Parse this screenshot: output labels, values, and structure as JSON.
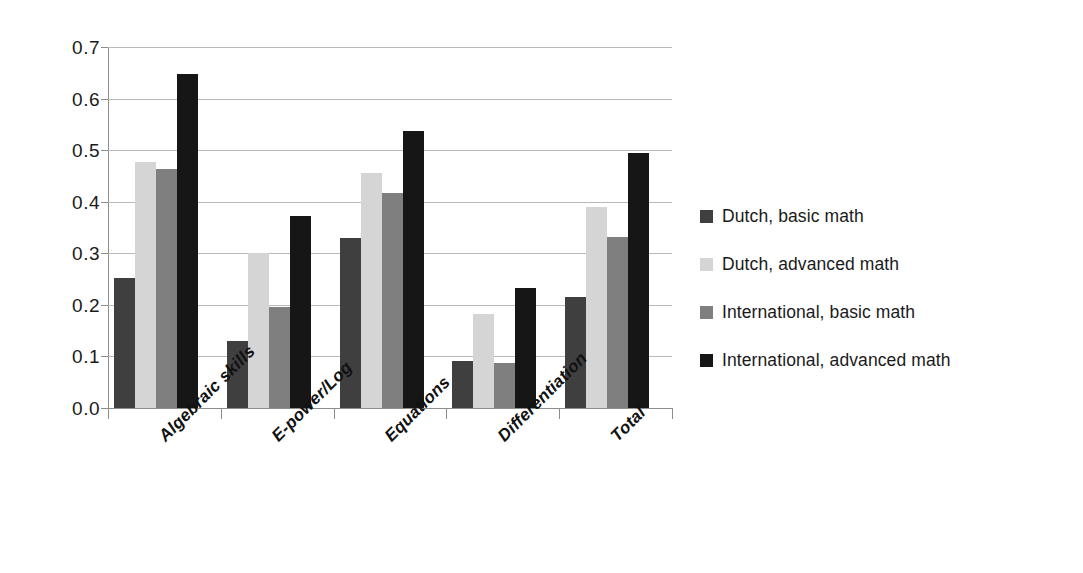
{
  "chart_data": {
    "type": "bar",
    "title": "",
    "subtitle": "",
    "xlabel": "",
    "ylabel": "",
    "ylim": [
      0.0,
      0.7
    ],
    "ytick_labels": [
      "0.7",
      "0.6",
      "0.5",
      "0.4",
      "0.3",
      "0.2",
      "0.1",
      "0.0"
    ],
    "ytick_values": [
      0.7,
      0.6,
      0.5,
      0.4,
      0.3,
      0.2,
      0.1,
      0.0
    ],
    "grid": true,
    "grid_axis": "y",
    "legend_position": "right",
    "categories": [
      "Algebraic skills",
      "E-power/Log",
      "Equations",
      "Differentiation",
      "Total"
    ],
    "series": [
      {
        "name": "Dutch, basic math",
        "color": "#3f3f3f",
        "values": [
          0.253,
          0.129,
          0.33,
          0.091,
          0.215
        ]
      },
      {
        "name": "Dutch, advanced math",
        "color": "#d5d5d5",
        "values": [
          0.477,
          0.3,
          0.455,
          0.182,
          0.39
        ]
      },
      {
        "name": "International, basic math",
        "color": "#7f7f7f",
        "values": [
          0.463,
          0.195,
          0.417,
          0.088,
          0.332
        ]
      },
      {
        "name": "International, advanced math",
        "color": "#161616",
        "values": [
          0.647,
          0.373,
          0.537,
          0.233,
          0.494
        ]
      }
    ]
  },
  "colors": {
    "background": "#ffffff",
    "gridline": "#b9b9b9",
    "axis": "#8d8d8d",
    "text": "#1a1a1a"
  }
}
